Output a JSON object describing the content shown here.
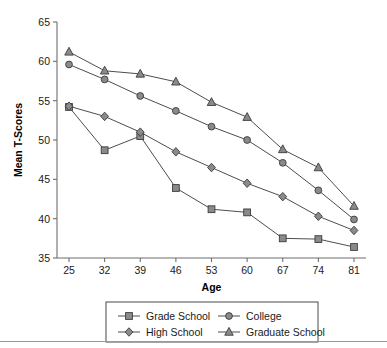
{
  "chart_data": {
    "type": "line",
    "title": "",
    "xlabel": "Age",
    "ylabel": "Mean T-Scores",
    "categories": [
      "25",
      "32",
      "39",
      "46",
      "53",
      "60",
      "67",
      "74",
      "81"
    ],
    "x": [
      25,
      32,
      39,
      46,
      53,
      60,
      67,
      74,
      81
    ],
    "xlim": [
      25,
      81
    ],
    "ylim": [
      35,
      65
    ],
    "yticks": [
      "35",
      "40",
      "45",
      "50",
      "55",
      "60",
      "65"
    ],
    "ytick_values": [
      35,
      40,
      45,
      50,
      55,
      60,
      65
    ],
    "grid": false,
    "legend_position": "bottom",
    "series": [
      {
        "name": "Grade School",
        "marker": "square",
        "values": [
          54.2,
          48.7,
          50.5,
          43.9,
          41.2,
          40.8,
          37.5,
          37.4,
          36.4
        ]
      },
      {
        "name": "High School",
        "marker": "diamond",
        "values": [
          54.3,
          53.0,
          51.0,
          48.5,
          46.5,
          44.5,
          42.8,
          40.3,
          38.5
        ]
      },
      {
        "name": "College",
        "marker": "circle",
        "values": [
          59.6,
          57.7,
          55.6,
          53.7,
          51.7,
          50.0,
          47.1,
          43.6,
          39.9
        ]
      },
      {
        "name": "Graduate School",
        "marker": "triangle",
        "values": [
          61.2,
          58.8,
          58.4,
          57.4,
          54.8,
          52.9,
          48.8,
          46.5,
          41.6
        ]
      }
    ],
    "colors": {
      "marker_fill": "#8a8a8a",
      "marker_stroke": "#3c3c3c",
      "line": "#4d4d4d",
      "axis": "#6e6e6e",
      "text": "#1a1a1a",
      "background": "#ffffff"
    }
  },
  "legend": {
    "entries": [
      {
        "label": "Grade School",
        "marker": "square"
      },
      {
        "label": "College",
        "marker": "circle"
      },
      {
        "label": "High School",
        "marker": "diamond"
      },
      {
        "label": "Graduate School",
        "marker": "triangle"
      }
    ]
  }
}
